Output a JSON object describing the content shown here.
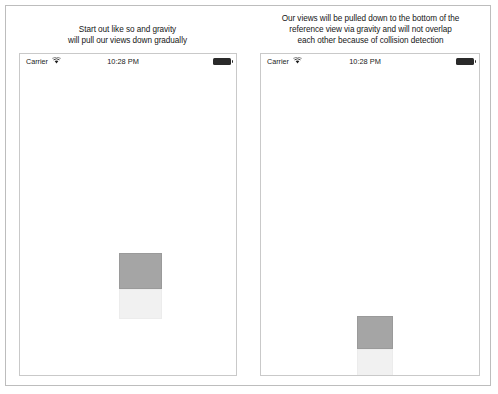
{
  "figure": {
    "background": "#ffffff",
    "border_color": "#bdbdbd"
  },
  "panels": [
    {
      "id": "left",
      "caption": "Start out like so and gravity\nwill pull our views down gradually",
      "device": {
        "status_bar": {
          "carrier": "Carrier",
          "wifi_icon": "wifi-icon",
          "time": "10:28 PM",
          "battery_icon": "battery-full-icon"
        },
        "boxes": [
          {
            "name": "gray-square",
            "color": "#a5a5a5",
            "border_color": "#9a9a9a",
            "left": 99,
            "top": 184,
            "width": 43,
            "height": 36
          },
          {
            "name": "light-square",
            "color": "#f1f1f1",
            "border_color": "#ececec",
            "left": 99,
            "top": 220,
            "width": 43,
            "height": 30
          }
        ]
      }
    },
    {
      "id": "right",
      "caption": "Our views will be pulled down to the bottom of the\nreference view via gravity and will not overlap\neach other because of collision detection",
      "device": {
        "status_bar": {
          "carrier": "Carrier",
          "wifi_icon": "wifi-icon",
          "time": "10:28 PM",
          "battery_icon": "battery-full-icon"
        },
        "boxes": [
          {
            "name": "gray-square",
            "color": "#a5a5a5",
            "border_color": "#9a9a9a",
            "left": 96,
            "top": 247,
            "width": 36,
            "height": 33
          },
          {
            "name": "light-square",
            "color": "#f1f1f1",
            "border_color": "#ececec",
            "left": 96,
            "top": 280,
            "width": 36,
            "height": 33
          }
        ]
      }
    }
  ]
}
